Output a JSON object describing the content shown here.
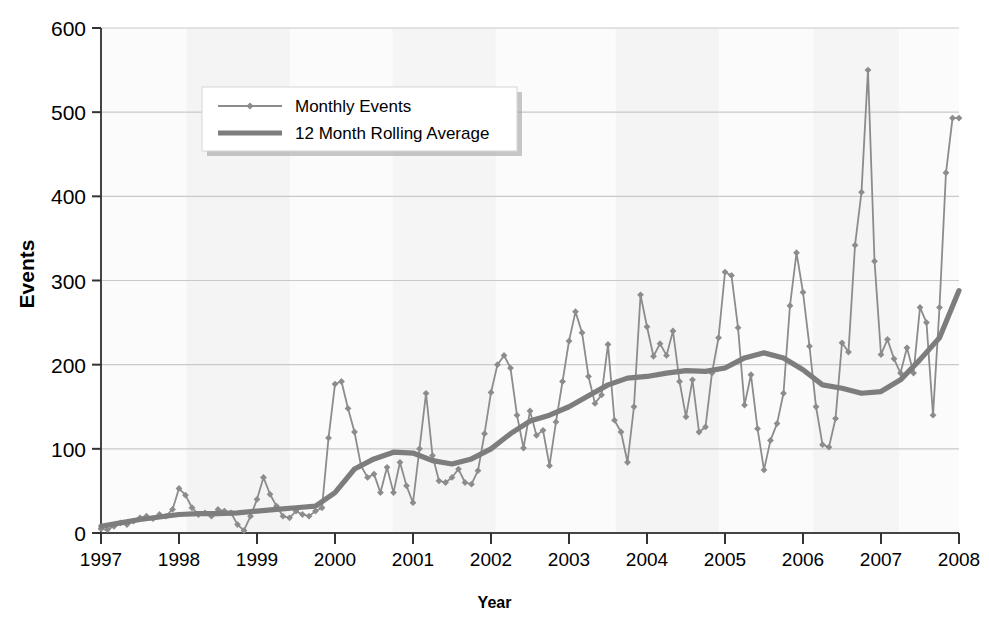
{
  "chart_data": {
    "type": "line",
    "title": "",
    "xlabel": "Year",
    "ylabel": "Events",
    "xlim": [
      1997,
      2008
    ],
    "ylim": [
      0,
      600
    ],
    "ytick_values": [
      0,
      100,
      200,
      300,
      400,
      500,
      600
    ],
    "ytick_labels": [
      "0",
      "100",
      "200",
      "300",
      "400",
      "500",
      "600"
    ],
    "xtick_values": [
      1997,
      1998,
      1999,
      2000,
      2001,
      2002,
      2003,
      2004,
      2005,
      2006,
      2007,
      2008
    ],
    "xtick_labels": [
      "1997",
      "1998",
      "1999",
      "2000",
      "2001",
      "2002",
      "2003",
      "2004",
      "2005",
      "2006",
      "2007",
      "2008"
    ],
    "grid": true,
    "legend_position": "top-left",
    "series": [
      {
        "name": "Monthly Events",
        "style": "thin-line-with-diamond-markers",
        "color": "#8c8c8c",
        "x": [
          1997.0,
          1997.083,
          1997.167,
          1997.25,
          1997.333,
          1997.417,
          1997.5,
          1997.583,
          1997.667,
          1997.75,
          1997.833,
          1997.917,
          1998.0,
          1998.083,
          1998.167,
          1998.25,
          1998.333,
          1998.417,
          1998.5,
          1998.583,
          1998.667,
          1998.75,
          1998.833,
          1998.917,
          1999.0,
          1999.083,
          1999.167,
          1999.25,
          1999.333,
          1999.417,
          1999.5,
          1999.583,
          1999.667,
          1999.75,
          1999.833,
          1999.917,
          2000.0,
          2000.083,
          2000.167,
          2000.25,
          2000.333,
          2000.417,
          2000.5,
          2000.583,
          2000.667,
          2000.75,
          2000.833,
          2000.917,
          2001.0,
          2001.083,
          2001.167,
          2001.25,
          2001.333,
          2001.417,
          2001.5,
          2001.583,
          2001.667,
          2001.75,
          2001.833,
          2001.917,
          2002.0,
          2002.083,
          2002.167,
          2002.25,
          2002.333,
          2002.417,
          2002.5,
          2002.583,
          2002.667,
          2002.75,
          2002.833,
          2002.917,
          2003.0,
          2003.083,
          2003.167,
          2003.25,
          2003.333,
          2003.417,
          2003.5,
          2003.583,
          2003.667,
          2003.75,
          2003.833,
          2003.917,
          2004.0,
          2004.083,
          2004.167,
          2004.25,
          2004.333,
          2004.417,
          2004.5,
          2004.583,
          2004.667,
          2004.75,
          2004.833,
          2004.917,
          2005.0,
          2005.083,
          2005.167,
          2005.25,
          2005.333,
          2005.417,
          2005.5,
          2005.583,
          2005.667,
          2005.75,
          2005.833,
          2005.917,
          2006.0,
          2006.083,
          2006.167,
          2006.25,
          2006.333,
          2006.417,
          2006.5,
          2006.583,
          2006.667,
          2006.75,
          2006.833,
          2006.917,
          2007.0,
          2007.083,
          2007.167,
          2007.25,
          2007.333,
          2007.417,
          2007.5,
          2007.583,
          2007.667,
          2007.75,
          2007.833,
          2007.917,
          2008.0
        ],
        "values": [
          5,
          4,
          8,
          12,
          10,
          14,
          18,
          20,
          17,
          22,
          20,
          28,
          53,
          45,
          30,
          22,
          24,
          20,
          28,
          26,
          24,
          10,
          3,
          20,
          40,
          66,
          46,
          32,
          20,
          18,
          26,
          22,
          20,
          26,
          30,
          113,
          177,
          180,
          148,
          120,
          80,
          66,
          70,
          48,
          78,
          48,
          84,
          56,
          36,
          100,
          166,
          92,
          62,
          60,
          66,
          76,
          60,
          58,
          74,
          118,
          167,
          200,
          211,
          196,
          140,
          101,
          145,
          116,
          122,
          80,
          132,
          180,
          228,
          263,
          238,
          186,
          154,
          164,
          224,
          134,
          120,
          84,
          150,
          283,
          245,
          210,
          225,
          211,
          240,
          180,
          138,
          182,
          120,
          126,
          190,
          232,
          310,
          306,
          244,
          152,
          188,
          124,
          75,
          110,
          130,
          166,
          270,
          333,
          286,
          222,
          150,
          105,
          102,
          136,
          226,
          215,
          342,
          405,
          550,
          323,
          212,
          230,
          207,
          190,
          220,
          190,
          268,
          250,
          140,
          268,
          428,
          493,
          493
        ]
      },
      {
        "name": "12 Month Rolling Average",
        "style": "thick-line",
        "color": "#7d7d7d",
        "x": [
          1997.0,
          1997.25,
          1997.5,
          1997.75,
          1998.0,
          1998.25,
          1998.5,
          1998.75,
          1999.0,
          1999.25,
          1999.5,
          1999.75,
          2000.0,
          2000.25,
          2000.5,
          2000.75,
          2001.0,
          2001.25,
          2001.5,
          2001.75,
          2002.0,
          2002.25,
          2002.5,
          2002.75,
          2003.0,
          2003.25,
          2003.5,
          2003.75,
          2004.0,
          2004.25,
          2004.5,
          2004.75,
          2005.0,
          2005.25,
          2005.5,
          2005.75,
          2006.0,
          2006.25,
          2006.5,
          2006.75,
          2007.0,
          2007.25,
          2007.5,
          2007.75,
          2008.0
        ],
        "values": [
          8,
          12,
          16,
          19,
          22,
          23,
          23,
          24,
          26,
          28,
          30,
          32,
          48,
          76,
          88,
          96,
          95,
          86,
          82,
          88,
          100,
          118,
          133,
          140,
          150,
          163,
          176,
          184,
          186,
          190,
          193,
          192,
          196,
          208,
          214,
          208,
          194,
          176,
          172,
          166,
          168,
          182,
          206,
          232,
          288
        ]
      }
    ]
  },
  "legend": {
    "entries": [
      {
        "label": "Monthly Events"
      },
      {
        "label": "12 Month Rolling Average"
      }
    ]
  }
}
